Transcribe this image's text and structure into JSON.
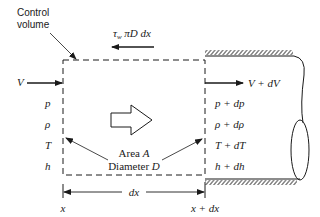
{
  "diagram": {
    "control_volume_label_line1": "Control",
    "control_volume_label_line2": "volume",
    "shear_force_label": "τw πD dx",
    "shear_force_tau": "τ",
    "shear_force_sub": "w",
    "shear_force_rest": " πD dx",
    "inlet": {
      "velocity": "V",
      "properties": [
        "p",
        "ρ",
        "T",
        "h"
      ]
    },
    "outlet": {
      "velocity": "V + dV",
      "properties": [
        "p + dp",
        "ρ + dρ",
        "T + dT",
        "h + dh"
      ]
    },
    "area_label": "Area A",
    "diameter_label": "Diameter D",
    "length_label": "dx",
    "x_start_label": "x",
    "x_end_label": "x + dx",
    "colors": {
      "ink": "#1a1a1a",
      "background": "#ffffff"
    }
  }
}
